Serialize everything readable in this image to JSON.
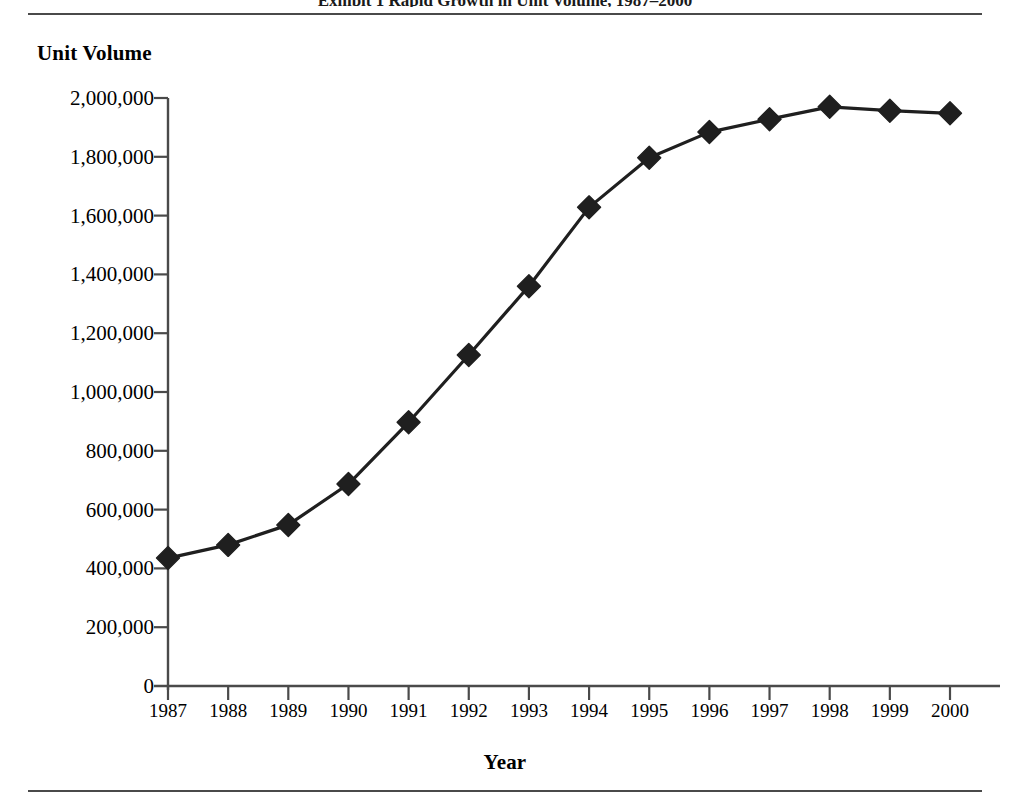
{
  "page": {
    "clipped_running_head": "Exhibit 1  Rapid Growth in Unit Volume, 1987–2000"
  },
  "chart_data": {
    "type": "line",
    "title": "",
    "xlabel": "Year",
    "ylabel": "Unit Volume",
    "categories": [
      "1987",
      "1988",
      "1989",
      "1990",
      "1991",
      "1992",
      "1993",
      "1994",
      "1995",
      "1996",
      "1997",
      "1998",
      "1999",
      "2000"
    ],
    "values": [
      435000,
      480000,
      548000,
      687000,
      897000,
      1126000,
      1360000,
      1628000,
      1797000,
      1884000,
      1928000,
      1970000,
      1957000,
      1948000
    ],
    "ylim": [
      0,
      2000000
    ],
    "yticks": [
      0,
      200000,
      400000,
      600000,
      800000,
      1000000,
      1200000,
      1400000,
      1600000,
      1800000,
      2000000
    ],
    "ytick_labels": [
      "0",
      "200,000",
      "400,000",
      "600,000",
      "800,000",
      "1,000,000",
      "1,200,000",
      "1,400,000",
      "1,600,000",
      "1,800,000",
      "2,000,000"
    ],
    "grid": false,
    "legend": false,
    "marker": "diamond",
    "series_color": "#1f1f1f",
    "axis_color": "#4a4a4a"
  }
}
